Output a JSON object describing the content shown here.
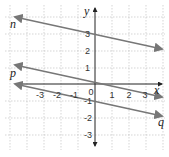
{
  "diagram": {
    "title": "",
    "axes": {
      "x_label": "x",
      "y_label": "y",
      "x_ticks": [
        "-3",
        "-2",
        "-1",
        "0",
        "1",
        "2",
        "3"
      ],
      "y_ticks": [
        "3",
        "2",
        "1",
        "-1",
        "-2",
        "-3"
      ]
    },
    "lines": [
      {
        "name": "n",
        "label": "n",
        "color": "#777777"
      },
      {
        "name": "p",
        "label": "p",
        "color": "#777777"
      },
      {
        "name": "q",
        "label": "q",
        "color": "#777777"
      }
    ],
    "grid_color": "#bbbbbb"
  }
}
